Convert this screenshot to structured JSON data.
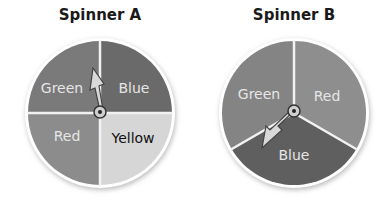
{
  "spinners": [
    {
      "title": "Spinner A",
      "sections": [
        {
          "label": "Green",
          "fill": "#7a7a7a",
          "text_color": "#e6e6e6"
        },
        {
          "label": "Blue",
          "fill": "#6a6a6a",
          "text_color": "#e6e6e6"
        },
        {
          "label": "Yellow",
          "fill": "#d6d6d6",
          "text_color": "#111111"
        },
        {
          "label": "Red",
          "fill": "#8c8c8c",
          "text_color": "#e6e6e6"
        }
      ],
      "arrow_points_to": "Green"
    },
    {
      "title": "Spinner B",
      "sections": [
        {
          "label": "Red",
          "fill": "#8e8e8e",
          "text_color": "#e6e6e6"
        },
        {
          "label": "Blue",
          "fill": "#5f5f5f",
          "text_color": "#e6e6e6"
        },
        {
          "label": "Green",
          "fill": "#848484",
          "text_color": "#e6e6e6"
        }
      ],
      "arrow_points_to": "Blue"
    }
  ]
}
